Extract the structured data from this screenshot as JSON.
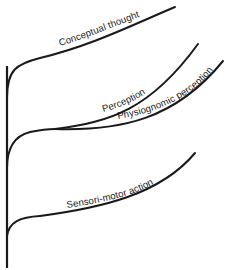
{
  "diagram": {
    "type": "branching-tree",
    "colors": {
      "background": "#ffffff",
      "stroke": "#1a1a1a"
    },
    "branches": [
      {
        "id": "conceptual-thought",
        "label": "Conceptual thought",
        "order_from_top": 1
      },
      {
        "id": "perception",
        "label": "Perception",
        "order_from_top": 2
      },
      {
        "id": "physiognomic-perception",
        "label": "Physiognomic perception",
        "order_from_top": 3
      },
      {
        "id": "sensori-motor-action",
        "label": "Sensori-motor action",
        "order_from_top": 4
      }
    ]
  }
}
